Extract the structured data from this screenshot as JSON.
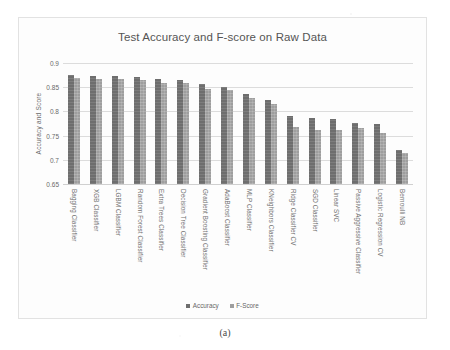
{
  "figure": {
    "caption": "(a)"
  },
  "chart_data": {
    "type": "bar",
    "title": "Test Accuracy and F-score on Raw Data",
    "xlabel": "",
    "ylabel": "Accuracy and Score",
    "ylim": [
      0.65,
      0.9
    ],
    "yticks": [
      0.9,
      0.85,
      0.8,
      0.75,
      0.7,
      0.65
    ],
    "ytick_labels": [
      "0.9",
      "0.85",
      "0.8",
      "0.75",
      "0.7",
      "0.65"
    ],
    "grid": true,
    "legend_position": "bottom",
    "colors": {
      "accuracy": "#6e6e6e",
      "fscore": "#9e9e9e"
    },
    "categories": [
      "Bagging Classifier",
      "XGB Classifier",
      "LGBM Classifier",
      "Random Forest Classifier",
      "Extra Trees Classifier",
      "Decision Tree Classifier",
      "Gradient Boosting Classifier",
      "AdaBoost Classifier",
      "MLP Classifier",
      "KNeighbors Classifier",
      "Ridge Classifier CV",
      "SGD Classifier",
      "Linear SVC",
      "Passive Aggressive Classifier",
      "Logistic Regression CV",
      "Bernoulli NB"
    ],
    "series": [
      {
        "name": "Accuracy",
        "values": [
          0.876,
          0.874,
          0.874,
          0.871,
          0.866,
          0.864,
          0.856,
          0.851,
          0.836,
          0.824,
          0.791,
          0.787,
          0.784,
          0.776,
          0.773,
          0.72
        ]
      },
      {
        "name": "F-Score",
        "values": [
          0.87,
          0.866,
          0.867,
          0.865,
          0.858,
          0.858,
          0.847,
          0.844,
          0.827,
          0.816,
          0.768,
          0.762,
          0.762,
          0.766,
          0.755,
          0.715
        ]
      }
    ]
  }
}
